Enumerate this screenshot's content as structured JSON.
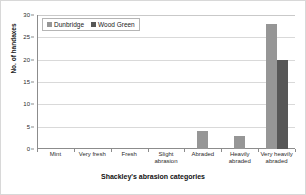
{
  "chart_data": {
    "type": "bar",
    "title": "",
    "xlabel": "Shackley's abrasion categories",
    "ylabel": "No. of handaxes",
    "categories": [
      "Mint",
      "Very fresh",
      "Fresh",
      "Slight abrasion",
      "Abraded",
      "Heavily abraded",
      "Very heavily abraded"
    ],
    "category_lines": [
      [
        "Mint"
      ],
      [
        "Very fresh"
      ],
      [
        "Fresh"
      ],
      [
        "Slight",
        "abrasion"
      ],
      [
        "Abraded"
      ],
      [
        "Heavily",
        "abraded"
      ],
      [
        "Very heavily",
        "abraded"
      ]
    ],
    "series": [
      {
        "name": "Dunbridge",
        "color": "#969696",
        "values": [
          0,
          0,
          0,
          0,
          4,
          3,
          28
        ]
      },
      {
        "name": "Wood Green",
        "color": "#575757",
        "values": [
          0,
          0,
          0,
          0,
          0,
          0,
          20
        ]
      }
    ],
    "ylim": [
      0,
      30
    ],
    "yticks": [
      0,
      5,
      10,
      15,
      20,
      25,
      30
    ],
    "ytick_labels": [
      "0",
      "5",
      "10",
      "15",
      "20",
      "25",
      "30"
    ],
    "grid": true,
    "grid_axis": "y",
    "legend_position": "top-left"
  },
  "legend": {
    "entries": [
      {
        "label": "Dunbridge",
        "color": "#969696"
      },
      {
        "label": "Wood Green",
        "color": "#575757"
      }
    ]
  }
}
